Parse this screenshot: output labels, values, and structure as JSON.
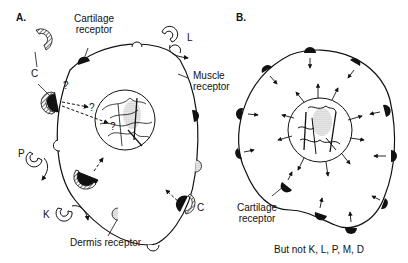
{
  "panels": {
    "a": {
      "label": "A.",
      "cartilage_receptor": "Cartilage\nreceptor",
      "cartilage_receptor_line1": "Cartilage",
      "cartilage_receptor_line2": "receptor",
      "muscle_receptor_line1": "Muscle",
      "muscle_receptor_line2": "receptor",
      "dermis_receptor": "Dermis receptor",
      "ligands": {
        "c_top": "C",
        "c_right": "C",
        "l": "L",
        "p": "P",
        "k": "K"
      },
      "question_marks": [
        "?",
        "?",
        "?"
      ]
    },
    "b": {
      "label": "B.",
      "cartilage_receptor_line1": "Cartilage",
      "cartilage_receptor_line2": "receptor",
      "caption": "But not K, L, P, M, D"
    }
  },
  "colors": {
    "ink": "#111111",
    "background": "#ffffff",
    "stipple": "#999999"
  }
}
